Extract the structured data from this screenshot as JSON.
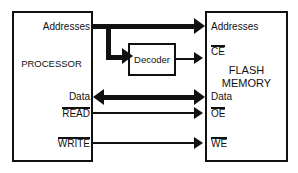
{
  "diagram": {
    "colors": {
      "line": "#111111",
      "background": "#ffffff",
      "text": "#111111"
    },
    "processor": {
      "name": "PROCESSOR",
      "ports": {
        "addresses": "Addresses",
        "data": "Data",
        "read": "READ",
        "write": "WRITE"
      }
    },
    "decoder": {
      "name": "Decoder"
    },
    "flash": {
      "name_line1": "FLASH",
      "name_line2": "MEMORY",
      "ports": {
        "addresses": "Addresses",
        "ce": "CE",
        "data": "Data",
        "oe": "OE",
        "we": "WE"
      }
    },
    "connections": [
      {
        "id": "address-bus",
        "from": "processor.addresses",
        "to": "flash.addresses",
        "style": "thick",
        "direction": "right"
      },
      {
        "id": "address-branch",
        "from": "processor.addresses",
        "to": "decoder",
        "style": "thick",
        "direction": "right"
      },
      {
        "id": "decoder-ce",
        "from": "decoder",
        "to": "flash.ce",
        "style": "thin",
        "direction": "right"
      },
      {
        "id": "data-bus",
        "from": "processor.data",
        "to": "flash.data",
        "style": "thick",
        "direction": "bidirectional"
      },
      {
        "id": "read-oe",
        "from": "processor.read",
        "to": "flash.oe",
        "style": "thin",
        "direction": "right"
      },
      {
        "id": "write-we",
        "from": "processor.write",
        "to": "flash.we",
        "style": "thin",
        "direction": "right"
      }
    ],
    "active_low_signals": [
      "READ",
      "WRITE",
      "CE",
      "OE",
      "WE"
    ]
  }
}
